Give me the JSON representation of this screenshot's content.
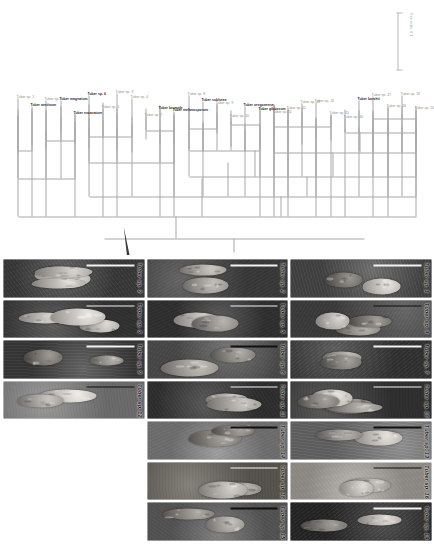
{
  "figure": {
    "type": "phylogenetic-tree-and-specimen-plate",
    "orientation": "rotated-90",
    "background_color": "#ffffff"
  },
  "tree": {
    "scale": {
      "label": "Tree scale: 0.1",
      "value": "0.1",
      "line_color": "#a8a8a8"
    },
    "style": {
      "line_color": "#a8a8a8",
      "label_color": "#8d8d8d",
      "bold_label_color": "#2a2a2a",
      "collapsed_clade_color": "#3b3b3b"
    },
    "tips": [
      {
        "label": "Tuber sp. 20",
        "bold": false
      },
      {
        "label": "Tuber sp. 19",
        "bold": false
      },
      {
        "label": "Tuber sp. 18",
        "bold": false
      },
      {
        "label": "Tuber sp. 17",
        "bold": false
      },
      {
        "label": "Tuber borchii",
        "bold": true
      },
      {
        "label": "Tuber sp. 16",
        "bold": false
      },
      {
        "label": "Tuber sp. 15",
        "bold": false
      },
      {
        "label": "Tuber sp. 14",
        "bold": false
      },
      {
        "label": "Tuber sp. 13",
        "bold": false
      },
      {
        "label": "Tuber sp. 12",
        "bold": false
      },
      {
        "label": "Tuber sp. 11",
        "bold": false
      },
      {
        "label": "Tuber gibbosum",
        "bold": true
      },
      {
        "label": "Tuber oregonense",
        "bold": true
      },
      {
        "label": "Tuber sp. 10",
        "bold": false
      },
      {
        "label": "Tuber sp. 9",
        "bold": false
      },
      {
        "label": "Tuber sublutea",
        "bold": true
      },
      {
        "label": "Tuber sp. 8",
        "bold": false
      },
      {
        "label": "Tuber melanosporum",
        "bold": true
      },
      {
        "label": "Tuber brumale",
        "bold": true
      },
      {
        "label": "Tuber sp. 7",
        "bold": false
      },
      {
        "label": "Tuber sp. 4",
        "bold": false
      },
      {
        "label": "Tuber sp. 3",
        "bold": false
      },
      {
        "label": "Tuber sp. 5",
        "bold": false
      },
      {
        "label": "Tuber sp. 6",
        "bold": true
      },
      {
        "label": "Tuber excavatum",
        "bold": true
      },
      {
        "label": "Tuber magnatum",
        "bold": true
      },
      {
        "label": "Tuber sp. 2",
        "bold": false
      },
      {
        "label": "Tuber aestivum",
        "bold": true
      },
      {
        "label": "Tuber sp. 1",
        "bold": false
      }
    ],
    "collapsed_clade": {
      "present": true,
      "label": ""
    }
  },
  "plate": {
    "rows": 3,
    "columns": 7,
    "caption_prefix": "Tuber sp.",
    "cells": [
      {
        "label": "Tuber sp. 1",
        "bar": "light",
        "bg": "#545454",
        "count": 2
      },
      {
        "label": "Tuber sp. 4",
        "bar": "dark",
        "bg": "#4b4b4b",
        "count": 3
      },
      {
        "label": "Tuber sp. 7",
        "bar": "light",
        "bg": "#3f3f3f",
        "count": 3
      },
      {
        "label": "Tuber sp. 10",
        "bar": "light",
        "bg": "#3b3b3b",
        "count": 4
      },
      {
        "label": "Tuber sp. 13",
        "bar": "dark",
        "bg": "#7d7d7d",
        "count": 2
      },
      {
        "label": "Tuber sp. 16",
        "bar": "dark",
        "bg": "#b9b4ad",
        "count": 2
      },
      {
        "label": "Tuber sp. 19",
        "bar": "light",
        "bg": "#2f2f2f",
        "count": 2
      },
      {
        "label": "Tuber sp. 2",
        "bar": "light",
        "bg": "#484848",
        "count": 2
      },
      {
        "label": "Tuber sp. 5",
        "bar": "light",
        "bg": "#3c3c3c",
        "count": 2
      },
      {
        "label": "Tuber sp. 8",
        "bar": "dark",
        "bg": "#5c5c5c",
        "count": 2
      },
      {
        "label": "Tuber sp. 11",
        "bar": "light",
        "bg": "#3a3a3a",
        "count": 2
      },
      {
        "label": "Tuber sp. 14",
        "bar": "dark",
        "bg": "#8e8e8e",
        "count": 2
      },
      {
        "label": "Tuber sp. 18",
        "bar": "light",
        "bg": "#6e6a62",
        "count": 2
      },
      {
        "label": "Tuber sp. 15",
        "bar": "dark",
        "bg": "#6a6a6a",
        "count": 2
      },
      {
        "label": "Tuber sp. 3",
        "bar": "light",
        "bg": "#484848",
        "count": 4
      },
      {
        "label": "Tuber sp. 6",
        "bar": "light",
        "bg": "#3e3e3e",
        "count": 4
      },
      {
        "label": "Tuber sp. 9",
        "bar": "light",
        "bg": "#474747",
        "count": 2
      },
      {
        "label": "Tuber sp. 12",
        "bar": "dark",
        "bg": "#8a8a8a",
        "count": 2
      }
    ]
  }
}
